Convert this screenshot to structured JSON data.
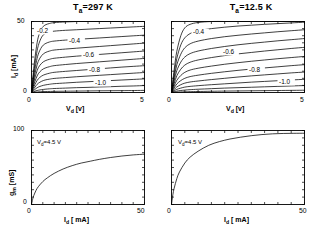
{
  "figure": {
    "panels": [
      {
        "id": "iv-297k",
        "title_main": "T",
        "title_sub": "a",
        "title_rest": "=297 K",
        "title_full": "Ta=297 K",
        "xlabel_main": "V",
        "xlabel_sub": "d",
        "xlabel_unit": " [v]",
        "ylabel_main": "I",
        "ylabel_sub": "d",
        "ylabel_unit": " [mA]",
        "xticks": [
          "0",
          "5"
        ],
        "yticks": [
          "0",
          "50"
        ],
        "curve_labels": [
          "-0.2",
          "-0.4",
          "-0.6",
          "-0.8",
          "-1.0"
        ]
      },
      {
        "id": "iv-12p5k",
        "title_main": "T",
        "title_sub": "a",
        "title_rest": "=12.5 K",
        "title_full": "Ta=12.5 K",
        "xlabel_main": "V",
        "xlabel_sub": "d",
        "xlabel_unit": " [v]",
        "xticks": [
          "0",
          "5"
        ],
        "curve_labels": [
          "-0.4",
          "-0.6",
          "-0.8",
          "-1.0"
        ]
      },
      {
        "id": "gm-297k",
        "xlabel_main": "I",
        "xlabel_sub": "d",
        "xlabel_unit": " [ mA]",
        "ylabel_main": "g",
        "ylabel_sub": "m",
        "ylabel_unit": " [mS]",
        "xticks": [
          "0",
          "50"
        ],
        "yticks": [
          "0",
          "100"
        ],
        "annotation_main": "V",
        "annotation_sub": "d",
        "annotation_rest": "=4.5 V",
        "annotation_full": "Vd=4.5 V"
      },
      {
        "id": "gm-12p5k",
        "xlabel_main": "I",
        "xlabel_sub": "d",
        "xlabel_unit": " [ mA]",
        "xticks": [
          "0",
          "50"
        ],
        "annotation_main": "V",
        "annotation_sub": "d",
        "annotation_rest": "=4.5 V",
        "annotation_full": "Vd=4.5 V"
      }
    ]
  },
  "chart_data": [
    {
      "type": "line",
      "id": "iv-297k",
      "title": "Ta=297 K",
      "xlabel": "Vd [v]",
      "ylabel": "Id [mA]",
      "xlim": [
        0,
        5
      ],
      "ylim": [
        0,
        50
      ],
      "grid": false,
      "legend": "inline-curve-labels",
      "annotations": [
        "-0.2",
        "-0.4",
        "-0.6",
        "-0.8",
        "-1.0"
      ],
      "series": [
        {
          "name": "Vg = -0.2 V",
          "x": [
            0,
            0.1,
            0.2,
            0.3,
            0.45,
            0.6,
            0.8,
            1.0,
            1.5,
            2.0,
            2.5,
            3.0,
            3.5,
            4.0,
            4.5,
            5.0
          ],
          "values": [
            0,
            17,
            30,
            39,
            45,
            47.5,
            48.6,
            49.2,
            49.7,
            50,
            50,
            50,
            50,
            50,
            50,
            50
          ]
        },
        {
          "name": "curve-2",
          "x": [
            0,
            0.1,
            0.2,
            0.3,
            0.45,
            0.6,
            0.8,
            1.0,
            1.5,
            2.0,
            2.5,
            3.0,
            3.5,
            4.0,
            4.5,
            5.0
          ],
          "values": [
            0,
            14,
            25,
            33,
            39,
            41.5,
            42.6,
            43.2,
            43.8,
            44.2,
            44.6,
            45,
            45.4,
            45.8,
            46.2,
            46.6
          ]
        },
        {
          "name": "Vg = -0.4 V",
          "x": [
            0,
            0.1,
            0.2,
            0.3,
            0.45,
            0.6,
            0.8,
            1.0,
            1.5,
            2.0,
            2.5,
            3.0,
            3.5,
            4.0,
            4.5,
            5.0
          ],
          "values": [
            0,
            11.5,
            20.5,
            27,
            32,
            34.3,
            35.6,
            36.2,
            36.9,
            37.4,
            37.9,
            38.4,
            38.9,
            39.4,
            39.9,
            40.4
          ]
        },
        {
          "name": "curve-4",
          "x": [
            0,
            0.1,
            0.2,
            0.3,
            0.45,
            0.6,
            0.8,
            1.0,
            1.5,
            2.0,
            2.5,
            3.0,
            3.5,
            4.0,
            4.5,
            5.0
          ],
          "values": [
            0,
            9.2,
            16.5,
            22,
            26,
            28,
            29.2,
            29.9,
            30.6,
            31.2,
            31.8,
            32.4,
            33,
            33.6,
            34.2,
            34.8
          ]
        },
        {
          "name": "Vg = -0.6 V",
          "x": [
            0,
            0.1,
            0.2,
            0.3,
            0.45,
            0.6,
            0.8,
            1.0,
            1.5,
            2.0,
            2.5,
            3.0,
            3.5,
            4.0,
            4.5,
            5.0
          ],
          "values": [
            0,
            7.2,
            13,
            17.4,
            20.6,
            22.3,
            23.4,
            24.1,
            24.9,
            25.6,
            26.2,
            26.8,
            27.4,
            28,
            28.6,
            29.2
          ]
        },
        {
          "name": "curve-6",
          "x": [
            0,
            0.1,
            0.2,
            0.3,
            0.45,
            0.6,
            0.8,
            1.0,
            1.5,
            2.0,
            2.5,
            3.0,
            3.5,
            4.0,
            4.5,
            5.0
          ],
          "values": [
            0,
            5.4,
            9.8,
            13.2,
            15.8,
            17.2,
            18.2,
            18.9,
            19.7,
            20.4,
            21,
            21.6,
            22.2,
            22.8,
            23.4,
            24
          ]
        },
        {
          "name": "Vg = -0.8 V",
          "x": [
            0,
            0.1,
            0.2,
            0.3,
            0.45,
            0.6,
            0.8,
            1.0,
            1.5,
            2.0,
            2.5,
            3.0,
            3.5,
            4.0,
            4.5,
            5.0
          ],
          "values": [
            0,
            3.9,
            7.1,
            9.6,
            11.6,
            12.7,
            13.6,
            14.2,
            14.9,
            15.5,
            16.1,
            16.7,
            17.3,
            17.9,
            18.4,
            18.9
          ]
        },
        {
          "name": "curve-8",
          "x": [
            0,
            0.1,
            0.2,
            0.3,
            0.45,
            0.6,
            0.8,
            1.0,
            1.5,
            2.0,
            2.5,
            3.0,
            3.5,
            4.0,
            4.5,
            5.0
          ],
          "values": [
            0,
            2.6,
            4.8,
            6.5,
            7.9,
            8.8,
            9.4,
            9.9,
            10.5,
            11.1,
            11.6,
            12.1,
            12.6,
            13.1,
            13.6,
            14.1
          ]
        },
        {
          "name": "Vg = -1.0 V",
          "x": [
            0,
            0.1,
            0.2,
            0.3,
            0.45,
            0.6,
            0.8,
            1.0,
            1.5,
            2.0,
            2.5,
            3.0,
            3.5,
            4.0,
            4.5,
            5.0
          ],
          "values": [
            0,
            1.5,
            2.8,
            3.8,
            4.7,
            5.3,
            5.8,
            6.2,
            6.7,
            7.2,
            7.6,
            8,
            8.4,
            8.8,
            9.2,
            9.6
          ]
        },
        {
          "name": "curve-10",
          "x": [
            0,
            0.1,
            0.2,
            0.3,
            0.45,
            0.6,
            0.8,
            1.0,
            1.5,
            2.0,
            2.5,
            3.0,
            3.5,
            4.0,
            4.5,
            5.0
          ],
          "values": [
            0,
            0.6,
            1.2,
            1.6,
            2,
            2.3,
            2.6,
            2.8,
            3.1,
            3.4,
            3.6,
            3.9,
            4.1,
            4.4,
            4.6,
            4.9
          ]
        },
        {
          "name": "curve-11",
          "x": [
            0,
            0.2,
            0.5,
            1.0,
            2.0,
            3.0,
            4.0,
            5.0
          ],
          "values": [
            0,
            0.3,
            0.6,
            0.8,
            1.0,
            1.2,
            1.3,
            1.5
          ]
        }
      ]
    },
    {
      "type": "line",
      "id": "iv-12p5k",
      "title": "Ta=12.5 K",
      "xlabel": "Vd [v]",
      "ylabel": "Id [mA]",
      "xlim": [
        0,
        5
      ],
      "ylim": [
        0,
        50
      ],
      "grid": false,
      "legend": "inline-curve-labels",
      "annotations": [
        "-0.4",
        "-0.6",
        "-0.8",
        "-1.0"
      ],
      "series": [
        {
          "name": "curve-1",
          "x": [
            0,
            0.1,
            0.2,
            0.35,
            0.5,
            0.7,
            1.0,
            1.5,
            2.0,
            2.5,
            3.0,
            3.5,
            4.0,
            4.5,
            5.0
          ],
          "values": [
            0,
            16,
            29,
            40,
            45.5,
            48,
            49.3,
            50,
            50,
            50,
            50,
            50,
            50,
            50,
            50
          ]
        },
        {
          "name": "Vg = -0.4 V",
          "x": [
            0,
            0.1,
            0.2,
            0.35,
            0.5,
            0.7,
            1.0,
            1.5,
            2.0,
            2.5,
            3.0,
            3.5,
            4.0,
            4.5,
            5.0
          ],
          "values": [
            0,
            13,
            24,
            33.5,
            38.5,
            41.5,
            43.5,
            45,
            46,
            46.8,
            47.4,
            48,
            48.5,
            49,
            49.5
          ]
        },
        {
          "name": "curve-3",
          "x": [
            0,
            0.1,
            0.2,
            0.35,
            0.5,
            0.7,
            1.0,
            1.5,
            2.0,
            2.5,
            3.0,
            3.5,
            4.0,
            4.5,
            5.0
          ],
          "values": [
            0,
            10.5,
            19.5,
            27,
            31.5,
            34.3,
            36.2,
            38,
            39.3,
            40.3,
            41.2,
            42,
            42.8,
            43.5,
            44.2
          ]
        },
        {
          "name": "Vg = -0.6 V",
          "x": [
            0,
            0.1,
            0.2,
            0.35,
            0.5,
            0.7,
            1.0,
            1.5,
            2.0,
            2.5,
            3.0,
            3.5,
            4.0,
            4.5,
            5.0
          ],
          "values": [
            0,
            8.3,
            15.4,
            21.4,
            25,
            27.4,
            29.2,
            31,
            32.4,
            33.6,
            34.6,
            35.5,
            36.4,
            37.2,
            38
          ]
        },
        {
          "name": "curve-5",
          "x": [
            0,
            0.1,
            0.2,
            0.35,
            0.5,
            0.7,
            1.0,
            1.5,
            2.0,
            2.5,
            3.0,
            3.5,
            4.0,
            4.5,
            5.0
          ],
          "values": [
            0,
            6.3,
            11.8,
            16.4,
            19.3,
            21.3,
            22.9,
            24.6,
            26,
            27.2,
            28.2,
            29.2,
            30.1,
            31,
            31.8
          ]
        },
        {
          "name": "curve-6",
          "x": [
            0,
            0.1,
            0.2,
            0.35,
            0.5,
            0.7,
            1.0,
            1.5,
            2.0,
            2.5,
            3.0,
            3.5,
            4.0,
            4.5,
            5.0
          ],
          "values": [
            0,
            4.6,
            8.6,
            12,
            14.2,
            15.8,
            17.1,
            18.6,
            19.9,
            21,
            22,
            22.9,
            23.8,
            24.6,
            25.4
          ]
        },
        {
          "name": "Vg = -0.8 V",
          "x": [
            0,
            0.1,
            0.2,
            0.35,
            0.5,
            0.7,
            1.0,
            1.5,
            2.0,
            2.5,
            3.0,
            3.5,
            4.0,
            4.5,
            5.0
          ],
          "values": [
            0,
            3.2,
            6,
            8.4,
            10,
            11.2,
            12.2,
            13.5,
            14.6,
            15.6,
            16.5,
            17.3,
            18.1,
            18.9,
            19.6
          ]
        },
        {
          "name": "curve-8",
          "x": [
            0,
            0.1,
            0.2,
            0.35,
            0.5,
            0.7,
            1.0,
            1.5,
            2.0,
            2.5,
            3.0,
            3.5,
            4.0,
            4.5,
            5.0
          ],
          "values": [
            0,
            2.1,
            3.9,
            5.5,
            6.6,
            7.4,
            8.1,
            9.1,
            10,
            10.9,
            11.7,
            12.4,
            13.1,
            13.8,
            14.4
          ]
        },
        {
          "name": "Vg = -1.0 V",
          "x": [
            0,
            0.1,
            0.2,
            0.35,
            0.5,
            0.7,
            1.0,
            1.5,
            2.0,
            2.5,
            3.0,
            3.5,
            4.0,
            4.5,
            5.0
          ],
          "values": [
            0,
            1.2,
            2.2,
            3.1,
            3.8,
            4.3,
            4.8,
            5.5,
            6.1,
            6.7,
            7.3,
            7.8,
            8.3,
            8.8,
            9.3
          ]
        },
        {
          "name": "curve-10",
          "x": [
            0,
            0.1,
            0.2,
            0.35,
            0.5,
            0.7,
            1.0,
            1.5,
            2.0,
            2.5,
            3.0,
            3.5,
            4.0,
            4.5,
            5.0
          ],
          "values": [
            0,
            0.5,
            1,
            1.4,
            1.7,
            2,
            2.3,
            2.7,
            3.1,
            3.4,
            3.7,
            4,
            4.3,
            4.6,
            4.9
          ]
        },
        {
          "name": "curve-11",
          "x": [
            0,
            0.2,
            0.5,
            1.0,
            2.0,
            3.0,
            4.0,
            5.0
          ],
          "values": [
            0,
            0.25,
            0.5,
            0.7,
            1.0,
            1.2,
            1.4,
            1.6
          ]
        }
      ]
    },
    {
      "type": "line",
      "id": "gm-297k",
      "title": "",
      "xlabel": "Id [ mA]",
      "ylabel": "gm [mS]",
      "xlim": [
        0,
        50
      ],
      "ylim": [
        0,
        100
      ],
      "grid": false,
      "annotations": [
        "Vd=4.5 V"
      ],
      "series": [
        {
          "name": "gm vs Id at 297 K",
          "x": [
            0,
            0.5,
            1,
            2,
            3,
            5,
            7,
            10,
            14,
            18,
            22,
            26,
            30,
            35,
            40,
            45,
            50
          ],
          "values": [
            0,
            7,
            12,
            19,
            24,
            31,
            36,
            42,
            48,
            52.5,
            56,
            58.5,
            61,
            63.5,
            65.5,
            67,
            68
          ]
        }
      ]
    },
    {
      "type": "line",
      "id": "gm-12p5k",
      "title": "",
      "xlabel": "Id [ mA]",
      "ylabel": "gm [mS]",
      "xlim": [
        0,
        50
      ],
      "ylim": [
        0,
        100
      ],
      "grid": false,
      "annotations": [
        "Vd=4.5 V"
      ],
      "series": [
        {
          "name": "gm vs Id at 12.5 K",
          "x": [
            0,
            0.5,
            1,
            2,
            3,
            5,
            7,
            10,
            14,
            18,
            22,
            26,
            30,
            34,
            38,
            42,
            46,
            50
          ],
          "values": [
            0,
            13,
            22,
            35,
            44,
            56,
            64,
            72,
            80,
            85,
            88.5,
            91,
            93,
            94.5,
            95.5,
            96,
            96.2,
            96.3
          ]
        }
      ]
    }
  ]
}
